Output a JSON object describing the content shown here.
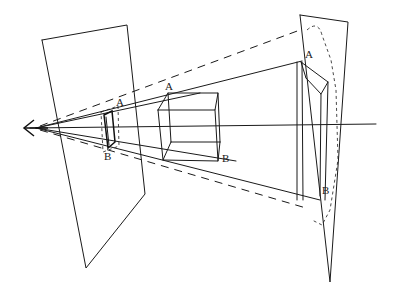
{
  "diagram": {
    "type": "perspective-projection",
    "labels": {
      "near_top": "A",
      "near_bottom": "B",
      "cube_top": "A",
      "cube_bottom": "B",
      "far_top": "A",
      "far_bottom": "B"
    },
    "elements": [
      "eye",
      "near-picture-plane",
      "near-image",
      "cube",
      "far-picture-plane",
      "far-image",
      "line-of-sight",
      "visual-rays",
      "dashed-rays"
    ],
    "colors": {
      "stroke": "#1a1a1a",
      "background": "#ffffff"
    }
  }
}
